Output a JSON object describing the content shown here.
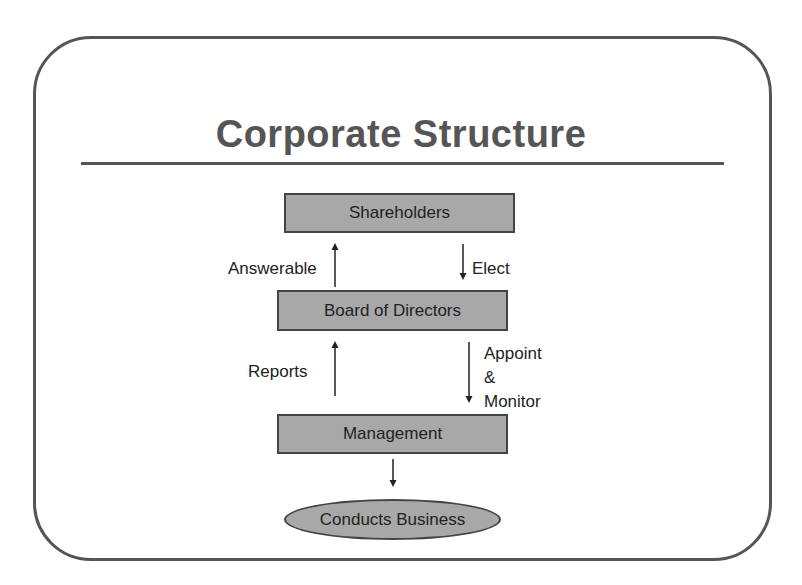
{
  "slide": {
    "title": "Corporate Structure",
    "colors": {
      "frame": "#555555",
      "title": "#555555",
      "box_fill": "#a8a8a8",
      "box_border": "#444444",
      "text": "#222222"
    }
  },
  "diagram": {
    "nodes": [
      {
        "id": "shareholders",
        "label": "Shareholders",
        "shape": "rectangle"
      },
      {
        "id": "board",
        "label": "Board of Directors",
        "shape": "rectangle"
      },
      {
        "id": "management",
        "label": "Management",
        "shape": "rectangle"
      },
      {
        "id": "business",
        "label": "Conducts Business",
        "shape": "ellipse"
      }
    ],
    "edges": [
      {
        "from": "board",
        "to": "shareholders",
        "label": "Answerable",
        "direction": "up"
      },
      {
        "from": "shareholders",
        "to": "board",
        "label": "Elect",
        "direction": "down"
      },
      {
        "from": "management",
        "to": "board",
        "label": "Reports",
        "direction": "up"
      },
      {
        "from": "board",
        "to": "management",
        "label": "Appoint & Monitor",
        "label_lines": [
          "Appoint",
          "&",
          "Monitor"
        ],
        "direction": "down"
      },
      {
        "from": "management",
        "to": "business",
        "label": "",
        "direction": "down"
      }
    ]
  }
}
